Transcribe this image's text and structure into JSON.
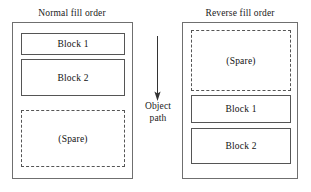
{
  "diagram": {
    "colors": {
      "stroke_solid": "#555555",
      "stroke_outer": "#6f6f6f",
      "stroke_dashed": "#555555",
      "background": "#ffffff",
      "text": "#1a1a1a"
    },
    "panels": [
      {
        "id": "normal",
        "title": "Normal fill order",
        "blocks": [
          {
            "label": "Block 1",
            "style": "solid"
          },
          {
            "label": "Block 2",
            "style": "solid"
          },
          {
            "label": "(Spare)",
            "style": "dashed"
          }
        ]
      },
      {
        "id": "reverse",
        "title": "Reverse fill order",
        "blocks": [
          {
            "label": "(Spare)",
            "style": "dashed"
          },
          {
            "label": "Block 1",
            "style": "solid"
          },
          {
            "label": "Block 2",
            "style": "solid"
          }
        ]
      }
    ],
    "arrow": {
      "icon": "arrow-down-icon",
      "direction": "down",
      "caption_line1": "Object",
      "caption_line2": "path"
    }
  }
}
